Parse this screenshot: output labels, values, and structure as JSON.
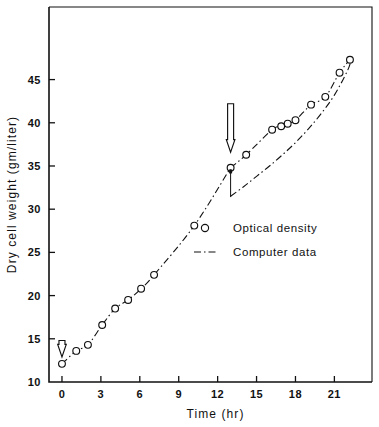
{
  "figure": {
    "background_color": "#ffffff",
    "ink_color": "#111111"
  },
  "axes": {
    "y_title": "Dry cell weight (gm/liter)",
    "x_title": "Time (hr)",
    "x_ticks": [
      "0",
      "3",
      "6",
      "9",
      "12",
      "15",
      "18",
      "21"
    ],
    "y_ticks": [
      "10",
      "15",
      "20",
      "25",
      "30",
      "35",
      "40",
      "45"
    ]
  },
  "legend": {
    "items": [
      {
        "marker": "open-circle-marker",
        "label": "Optical density"
      },
      {
        "marker": "dash-dot-line-marker",
        "label": "Computer data"
      }
    ]
  },
  "annotations": [
    {
      "name": "induction-arrow-start",
      "icon": "down-arrow-icon",
      "x": 0,
      "y_top": 14.8,
      "y_tip": 12.9
    },
    {
      "name": "induction-arrow-feed",
      "icon": "down-arrow-icon",
      "x": 13,
      "y_top": 42.2,
      "y_tip": 36.6
    },
    {
      "name": "step-change-marker",
      "icon": "vertical-tick-icon",
      "x": 13,
      "y_from": 34.6,
      "y_to": 31.4
    }
  ],
  "chart_data": {
    "type": "scatter",
    "title": "",
    "xlabel": "Time (hr)",
    "ylabel": "Dry cell weight (gm/liter)",
    "xlim": [
      -1.0,
      23.9
    ],
    "ylim": [
      10,
      53.4
    ],
    "grid": false,
    "legend_position": "center-right-inside",
    "series": [
      {
        "name": "Optical density",
        "type": "scatter",
        "marker": "open-circle",
        "x": [
          0.0,
          1.1,
          2.0,
          3.1,
          4.1,
          5.1,
          6.1,
          7.1,
          10.2,
          13.0,
          14.2,
          16.2,
          16.9,
          17.4,
          18.0,
          19.2,
          20.3,
          21.4,
          22.2
        ],
        "y": [
          12.1,
          13.6,
          14.3,
          16.6,
          18.5,
          19.5,
          20.8,
          22.4,
          28.1,
          34.8,
          36.3,
          39.2,
          39.6,
          39.9,
          40.3,
          42.1,
          43.0,
          45.8,
          47.3
        ]
      },
      {
        "name": "Computer data",
        "type": "line",
        "linestyle": "dash-dot",
        "x": [
          0.0,
          1.0,
          2.0,
          3.0,
          4.0,
          5.0,
          6.0,
          7.0,
          8.0,
          9.0,
          10.0,
          11.0,
          12.0,
          13.0,
          14.0,
          15.0,
          16.0,
          17.0,
          18.0,
          19.0,
          20.0,
          21.0,
          22.0,
          22.3
        ],
        "y": [
          12.0,
          13.4,
          14.8,
          16.4,
          18.0,
          19.5,
          20.9,
          22.3,
          24.0,
          25.9,
          27.9,
          29.2,
          30.4,
          31.5,
          32.6,
          33.8,
          35.0,
          36.3,
          37.7,
          39.3,
          41.1,
          43.2,
          46.0,
          47.3
        ]
      }
    ]
  }
}
